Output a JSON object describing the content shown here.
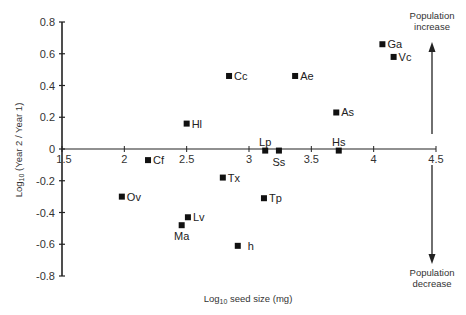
{
  "chart_data": {
    "type": "scatter",
    "title": "",
    "xlabel": "Log10 seed size (mg)",
    "xlabel_base": "Log",
    "xlabel_sub": "10",
    "xlabel_rest": " seed size (mg)",
    "ylabel": "Log10 (Year 2 / Year 1)",
    "ylabel_base": "Log",
    "ylabel_sub": "10",
    "ylabel_rest": " (Year 2 / Year 1)",
    "xlim": [
      1.5,
      4.5
    ],
    "ylim": [
      -0.8,
      0.8
    ],
    "x_ticks": [
      "1.5",
      "2",
      "2.5",
      "3",
      "3.5",
      "4",
      "4.5"
    ],
    "x_tick_values": [
      1.5,
      2,
      2.5,
      3,
      3.5,
      4,
      4.5
    ],
    "y_ticks": [
      "0.8",
      "0.6",
      "0.4",
      "0.2",
      "0",
      "-0.2",
      "-0.4",
      "-0.6",
      "-0.8"
    ],
    "y_tick_values": [
      0.8,
      0.6,
      0.4,
      0.2,
      0,
      -0.2,
      -0.4,
      -0.6,
      -0.8
    ],
    "grid": false,
    "legend": null,
    "points": [
      {
        "label": "Ga",
        "x": 4.07,
        "y": 0.66,
        "label_pos": "right"
      },
      {
        "label": "Vc",
        "x": 4.16,
        "y": 0.58,
        "label_pos": "right"
      },
      {
        "label": "Cc",
        "x": 2.84,
        "y": 0.46,
        "label_pos": "right"
      },
      {
        "label": "Ae",
        "x": 3.37,
        "y": 0.46,
        "label_pos": "right"
      },
      {
        "label": "As",
        "x": 3.7,
        "y": 0.23,
        "label_pos": "right"
      },
      {
        "label": "Hl",
        "x": 2.5,
        "y": 0.16,
        "label_pos": "right"
      },
      {
        "label": "Lp",
        "x": 3.13,
        "y": -0.01,
        "label_pos": "above"
      },
      {
        "label": "Ss",
        "x": 3.24,
        "y": -0.01,
        "label_pos": "below"
      },
      {
        "label": "Hs",
        "x": 3.72,
        "y": -0.01,
        "label_pos": "above"
      },
      {
        "label": "Cf",
        "x": 2.19,
        "y": -0.07,
        "label_pos": "right"
      },
      {
        "label": "Tx",
        "x": 2.79,
        "y": -0.18,
        "label_pos": "right"
      },
      {
        "label": "Ov",
        "x": 1.98,
        "y": -0.3,
        "label_pos": "right"
      },
      {
        "label": "Tp",
        "x": 3.12,
        "y": -0.31,
        "label_pos": "right"
      },
      {
        "label": "Lv",
        "x": 2.51,
        "y": -0.43,
        "label_pos": "right"
      },
      {
        "label": "Ma",
        "x": 2.46,
        "y": -0.48,
        "label_pos": "below"
      },
      {
        "label": "h",
        "x": 2.91,
        "y": -0.61,
        "label_pos": "right-far"
      }
    ],
    "annotations": [
      {
        "text": "Population increase",
        "lines": [
          "Population",
          "increase"
        ],
        "arrow": "up"
      },
      {
        "text": "Population decrease",
        "lines": [
          "Population",
          "decrease"
        ],
        "arrow": "down"
      }
    ]
  },
  "colors": {
    "axis": "#222222",
    "marker": "#111111",
    "text": "#333333",
    "background": "#ffffff"
  }
}
